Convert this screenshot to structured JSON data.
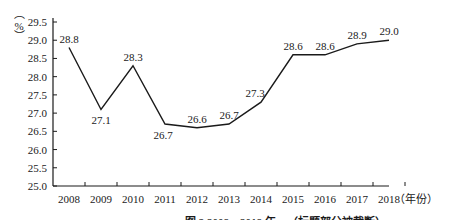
{
  "chart_data": {
    "type": "line",
    "title": "",
    "xlabel": "（年份）",
    "ylabel": "（%）",
    "categories": [
      "2008",
      "2009",
      "2010",
      "2011",
      "2012",
      "2013",
      "2014",
      "2015",
      "2016",
      "2017",
      "2018"
    ],
    "series": [
      {
        "name": "",
        "values": [
          28.8,
          27.1,
          28.3,
          26.7,
          26.6,
          26.7,
          27.3,
          28.6,
          28.6,
          28.9,
          29.0
        ],
        "labels": [
          "28.8",
          "27.1",
          "28.3",
          "26.7",
          "26.6",
          "26.7",
          "27.3",
          "28.6",
          "28.6",
          "28.9",
          "29.0"
        ]
      }
    ],
    "ylim": [
      25.0,
      29.5
    ],
    "yticks": [
      "25.0",
      "25.5",
      "26.0",
      "26.5",
      "27.0",
      "27.5",
      "28.0",
      "28.5",
      "29.0",
      "29.5"
    ],
    "grid": false,
    "legend": "none",
    "line_color": "#1a1a1a"
  },
  "caption": "图 3   2008—2018 年…（标题部分被截断）"
}
